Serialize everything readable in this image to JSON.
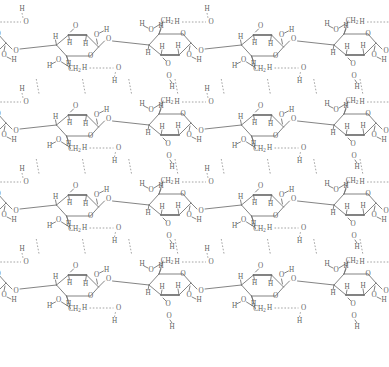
{
  "figure": {
    "kind": "chemical-structure-diagram",
    "width": 389,
    "height": 367,
    "background_color": "#ffffff",
    "bond_color": "#6e6e6e",
    "hbond_color": "#8d8d8d",
    "atom_label_color": "#5f5f5f",
    "chain_count": 4,
    "chain_vertical_spacing_px": 80,
    "repeat_unit_width_px": 185
  },
  "labels": {
    "hydrogen": "H",
    "oxygen": "O",
    "hydroxyl_o": "O",
    "ch2": "CH",
    "ch2_subscript": "2",
    "glycosidic_o": "O"
  },
  "chart_data": {
    "type": "diagram",
    "title": "",
    "atom_types": [
      "H",
      "O",
      "C"
    ],
    "explicit_labels": [
      "H",
      "O",
      "CH2"
    ],
    "bond_styles": [
      "solid-thin",
      "solid-thick-foreground",
      "dashed-hydrogen-bond"
    ],
    "chains": [
      {
        "index": 1,
        "baseline_y": 45,
        "repeat_units": 2
      },
      {
        "index": 2,
        "baseline_y": 125,
        "repeat_units": 2
      },
      {
        "index": 3,
        "baseline_y": 205,
        "repeat_units": 2
      },
      {
        "index": 4,
        "baseline_y": 285,
        "repeat_units": 2
      }
    ],
    "hydrogen_bonds": [
      {
        "type": "intra-chain",
        "donor": "O6-H",
        "acceptor": "O3",
        "style": "dashed-horizontal"
      },
      {
        "type": "intra-chain",
        "donor": "O3-H",
        "acceptor": "O5",
        "style": "dashed-horizontal"
      },
      {
        "type": "inter-chain",
        "donor": "O6-H",
        "acceptor": "O3",
        "style": "dashed-vertical"
      },
      {
        "type": "inter-chain",
        "donor": "O2-H",
        "acceptor": "O6",
        "style": "dashed-vertical"
      }
    ]
  }
}
